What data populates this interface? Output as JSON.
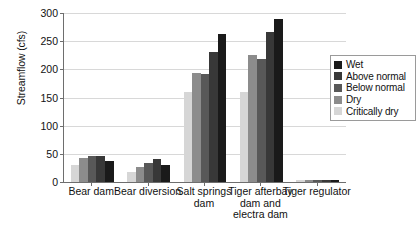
{
  "chart_data": {
    "type": "bar",
    "title": "",
    "xlabel": "",
    "ylabel": "Streamflow (cfs)",
    "ylim": [
      0,
      300
    ],
    "ytick_step": 50,
    "yticks": [
      0,
      50,
      100,
      150,
      200,
      250,
      300
    ],
    "ytick_labels": [
      "0",
      "50",
      "100",
      "150",
      "200",
      "250",
      "300"
    ],
    "grid": true,
    "legend_position": "right",
    "categories": [
      "Bear dam",
      "Bear diversion",
      "Salt springs dam",
      "Tiger afterbay dam and electra dam",
      "Tiger regulator"
    ],
    "category_label_lines": [
      [
        "Bear dam"
      ],
      [
        "Bear diversion"
      ],
      [
        "Salt springs",
        "dam"
      ],
      [
        "Tiger afterbay",
        "dam and",
        "electra dam"
      ],
      [
        "Tiger regulator"
      ]
    ],
    "series": [
      {
        "name": "Wet",
        "color": "#1a1a1a",
        "values": [
          37,
          30,
          263,
          290,
          4
        ]
      },
      {
        "name": "Above normal",
        "color": "#383838",
        "values": [
          46,
          41,
          231,
          266,
          4
        ]
      },
      {
        "name": "Below normal",
        "color": "#585858",
        "values": [
          47,
          34,
          191,
          219,
          4
        ]
      },
      {
        "name": "Dry",
        "color": "#8c8c8c",
        "values": [
          42,
          26,
          193,
          225,
          4
        ]
      },
      {
        "name": "Critically dry",
        "color": "#d6d6d6",
        "values": [
          31,
          18,
          160,
          160,
          3
        ]
      }
    ],
    "series_draw_order": [
      "Critically dry",
      "Dry",
      "Below normal",
      "Above normal",
      "Wet"
    ]
  },
  "legend": {
    "entries": [
      {
        "label": "Wet",
        "color": "#1a1a1a"
      },
      {
        "label": "Above normal",
        "color": "#383838"
      },
      {
        "label": "Below normal",
        "color": "#585858"
      },
      {
        "label": "Dry",
        "color": "#8c8c8c"
      },
      {
        "label": "Critically dry",
        "color": "#d6d6d6"
      }
    ]
  },
  "axis": {
    "line_color": "#6e6e6e",
    "grid_color": "#d8d8d8"
  }
}
